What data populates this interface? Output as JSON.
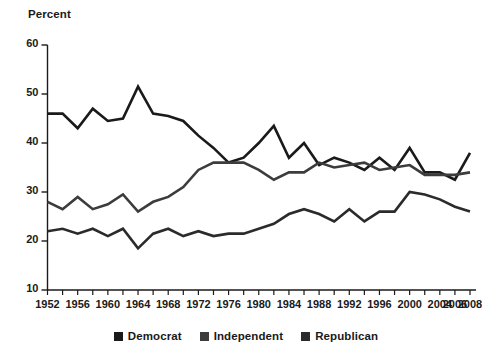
{
  "axis_title": "Percent",
  "legend": {
    "items": [
      {
        "label": "Democrat",
        "color": "#1a1a1a"
      },
      {
        "label": "Independent",
        "color": "#3c3c3c"
      },
      {
        "label": "Republican",
        "color": "#2b2b2b"
      }
    ]
  },
  "chart_data": {
    "type": "line",
    "title": "",
    "subtitle": "",
    "xlabel": "",
    "ylabel": "Percent",
    "ylim": [
      10,
      60
    ],
    "xlim": [
      1952,
      2008
    ],
    "grid": false,
    "legend_position": "bottom",
    "y_ticks": [
      10,
      20,
      30,
      40,
      50,
      60
    ],
    "x_ticks": [
      1952,
      1954,
      1956,
      1958,
      1960,
      1962,
      1964,
      1966,
      1968,
      1970,
      1972,
      1974,
      1976,
      1978,
      1980,
      1982,
      1984,
      1986,
      1988,
      1990,
      1992,
      1994,
      1996,
      1998,
      2000,
      2002,
      2004,
      2006,
      2008
    ],
    "x_tick_labels": [
      "1952",
      "",
      "1956",
      "",
      "1960",
      "",
      "1964",
      "",
      "1968",
      "",
      "1972",
      "",
      "1976",
      "",
      "1980",
      "",
      "1984",
      "",
      "1988",
      "",
      "1992",
      "",
      "1996",
      "",
      "2000",
      "",
      "2004",
      "2006",
      "2008"
    ],
    "x": [
      1952,
      1954,
      1956,
      1958,
      1960,
      1962,
      1964,
      1966,
      1968,
      1970,
      1972,
      1974,
      1976,
      1978,
      1980,
      1982,
      1984,
      1986,
      1988,
      1990,
      1992,
      1994,
      1996,
      1998,
      2000,
      2002,
      2004,
      2006,
      2008
    ],
    "series": [
      {
        "name": "Democrat",
        "color": "#1a1a1a",
        "values": [
          46.0,
          46.0,
          43.0,
          47.0,
          44.5,
          45.0,
          51.5,
          46.0,
          45.5,
          44.5,
          41.5,
          39.0,
          36.0,
          37.0,
          40.0,
          43.5,
          37.0,
          40.0,
          35.5,
          37.0,
          36.0,
          34.5,
          37.0,
          34.5,
          39.0,
          34.0,
          34.0,
          32.5,
          38.0
        ]
      },
      {
        "name": "Independent",
        "color": "#3c3c3c",
        "values": [
          28.0,
          26.5,
          29.0,
          26.5,
          27.5,
          29.5,
          26.0,
          28.0,
          29.0,
          31.0,
          34.5,
          36.0,
          36.0,
          36.0,
          34.5,
          32.5,
          34.0,
          34.0,
          36.0,
          35.0,
          35.5,
          36.0,
          34.5,
          35.0,
          35.5,
          33.5,
          33.5,
          33.5,
          34.0
        ]
      },
      {
        "name": "Republican",
        "color": "#2b2b2b",
        "values": [
          22.0,
          22.5,
          21.5,
          22.5,
          21.0,
          22.5,
          18.5,
          21.5,
          22.5,
          21.0,
          22.0,
          21.0,
          21.5,
          21.5,
          22.5,
          23.5,
          25.5,
          26.5,
          25.5,
          24.0,
          26.5,
          24.0,
          26.0,
          26.0,
          30.0,
          29.5,
          28.5,
          27.0,
          26.0
        ]
      }
    ]
  }
}
